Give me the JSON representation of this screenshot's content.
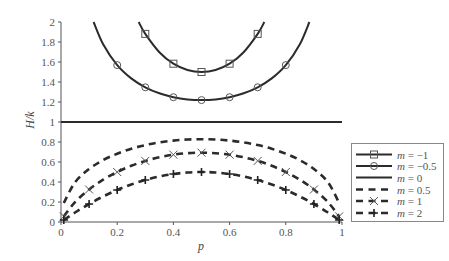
{
  "chart_data": {
    "type": "line",
    "title": "",
    "xlabel": "p",
    "ylabel": "H/k",
    "xlim": [
      0,
      1
    ],
    "ylim": [
      0,
      2
    ],
    "xticks": [
      "0",
      "0.2",
      "0.4",
      "0.6",
      "0.8",
      "1"
    ],
    "yticks": [
      "0",
      "0.2",
      "0.4",
      "0.6",
      "0.8",
      "1",
      "1.2",
      "1.4",
      "1.6",
      "1.8",
      "2"
    ],
    "grid": false,
    "legend_position": "lower right",
    "series": [
      {
        "name": "m = −1",
        "legend_m": "−1",
        "style": "solid",
        "marker": "square",
        "x": [
          0.2764,
          0.3,
          0.35,
          0.4,
          0.45,
          0.5,
          0.55,
          0.6,
          0.65,
          0.7,
          0.7236
        ],
        "values": [
          2.0,
          1.881,
          1.698,
          1.583,
          1.52,
          1.5,
          1.52,
          1.583,
          1.698,
          1.881,
          2.0
        ],
        "marker_x": [
          0.3,
          0.4,
          0.5,
          0.6,
          0.7
        ],
        "marker_values": [
          1.881,
          1.583,
          1.5,
          1.583,
          1.881
        ]
      },
      {
        "name": "m = −0.5",
        "legend_m": "−0.5",
        "style": "solid",
        "marker": "circle",
        "x": [
          0.116,
          0.15,
          0.2,
          0.25,
          0.3,
          0.35,
          0.4,
          0.45,
          0.5,
          0.55,
          0.6,
          0.65,
          0.7,
          0.75,
          0.8,
          0.85,
          0.884
        ],
        "values": [
          2.0,
          1.778,
          1.569,
          1.436,
          1.347,
          1.287,
          1.248,
          1.226,
          1.219,
          1.226,
          1.248,
          1.287,
          1.347,
          1.436,
          1.569,
          1.778,
          2.0
        ],
        "marker_x": [
          0.2,
          0.3,
          0.4,
          0.5,
          0.6,
          0.7,
          0.8
        ],
        "marker_values": [
          1.569,
          1.347,
          1.248,
          1.219,
          1.248,
          1.347,
          1.569
        ]
      },
      {
        "name": "m = 0",
        "legend_m": "0",
        "style": "solid-thick",
        "marker": "none",
        "x": [
          0,
          1
        ],
        "values": [
          1,
          1
        ],
        "marker_x": [],
        "marker_values": []
      },
      {
        "name": "m = 0.5",
        "legend_m": "0.5",
        "style": "dashed",
        "marker": "none",
        "x": [
          0.01,
          0.05,
          0.1,
          0.15,
          0.2,
          0.25,
          0.3,
          0.35,
          0.4,
          0.45,
          0.5,
          0.55,
          0.6,
          0.65,
          0.7,
          0.75,
          0.8,
          0.85,
          0.9,
          0.95,
          0.99
        ],
        "values": [
          0.19,
          0.397,
          0.53,
          0.619,
          0.683,
          0.732,
          0.769,
          0.796,
          0.814,
          0.825,
          0.828,
          0.825,
          0.814,
          0.796,
          0.769,
          0.732,
          0.683,
          0.619,
          0.53,
          0.397,
          0.19
        ],
        "marker_x": [],
        "marker_values": []
      },
      {
        "name": "m = 1",
        "legend_m": "1",
        "style": "dashed",
        "marker": "x",
        "x": [
          0.01,
          0.05,
          0.1,
          0.15,
          0.2,
          0.25,
          0.3,
          0.35,
          0.4,
          0.45,
          0.5,
          0.55,
          0.6,
          0.65,
          0.7,
          0.75,
          0.8,
          0.85,
          0.9,
          0.95,
          0.99
        ],
        "values": [
          0.056,
          0.199,
          0.325,
          0.423,
          0.5,
          0.562,
          0.611,
          0.647,
          0.673,
          0.688,
          0.693,
          0.688,
          0.673,
          0.647,
          0.611,
          0.562,
          0.5,
          0.423,
          0.325,
          0.199,
          0.056
        ],
        "marker_x": [
          0.01,
          0.1,
          0.2,
          0.3,
          0.4,
          0.5,
          0.6,
          0.7,
          0.8,
          0.9,
          0.99
        ],
        "marker_values": [
          0.056,
          0.325,
          0.5,
          0.611,
          0.673,
          0.693,
          0.673,
          0.611,
          0.5,
          0.325,
          0.056
        ]
      },
      {
        "name": "m = 2",
        "legend_m": "2",
        "style": "dashed",
        "marker": "plus",
        "x": [
          0.01,
          0.05,
          0.1,
          0.15,
          0.2,
          0.25,
          0.3,
          0.35,
          0.4,
          0.45,
          0.5,
          0.55,
          0.6,
          0.65,
          0.7,
          0.75,
          0.8,
          0.85,
          0.9,
          0.95,
          0.99
        ],
        "values": [
          0.02,
          0.095,
          0.18,
          0.255,
          0.32,
          0.375,
          0.42,
          0.455,
          0.48,
          0.495,
          0.5,
          0.495,
          0.48,
          0.455,
          0.42,
          0.375,
          0.32,
          0.255,
          0.18,
          0.095,
          0.02
        ],
        "marker_x": [
          0.01,
          0.1,
          0.2,
          0.3,
          0.4,
          0.5,
          0.6,
          0.7,
          0.8,
          0.9,
          0.99
        ],
        "marker_values": [
          0.02,
          0.18,
          0.32,
          0.42,
          0.48,
          0.5,
          0.48,
          0.42,
          0.32,
          0.18,
          0.02
        ]
      }
    ]
  },
  "legend": {
    "var": "m",
    "eq": " = "
  },
  "colors": {
    "line": "#2b2b2b",
    "axis": "#555555",
    "marker_stroke": "#555555",
    "legend_border": "#888888"
  }
}
